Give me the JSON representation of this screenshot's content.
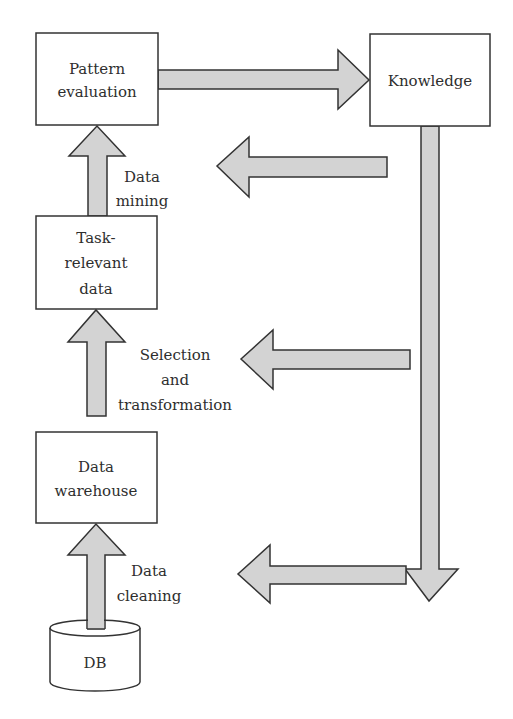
{
  "diagram": {
    "type": "flowchart",
    "colors": {
      "background": "#ffffff",
      "stroke": "#333333",
      "arrow_fill": "#d3d3d3",
      "text": "#2e2e2e"
    },
    "nodes": {
      "pattern_evaluation": {
        "line1": "Pattern",
        "line2": "evaluation"
      },
      "knowledge": {
        "label": "Knowledge"
      },
      "task_relevant_data": {
        "line1": "Task-",
        "line2": "relevant",
        "line3": "data"
      },
      "data_warehouse": {
        "line1": "Data",
        "line2": "warehouse"
      },
      "db": {
        "label": "DB"
      }
    },
    "edges": {
      "data_mining": {
        "line1": "Data",
        "line2": "mining",
        "from": "Task-relevant data",
        "to": "Pattern evaluation"
      },
      "selection_transformation": {
        "line1": "Selection",
        "line2": "and",
        "line3": "transformation",
        "from": "Data warehouse",
        "to": "Task-relevant data"
      },
      "data_cleaning": {
        "line1": "Data",
        "line2": "cleaning",
        "from": "DB",
        "to": "Data warehouse"
      },
      "evaluation_to_knowledge": {
        "from": "Pattern evaluation",
        "to": "Knowledge"
      },
      "feedback": [
        {
          "direction": "left",
          "level": "Pattern evaluation"
        },
        {
          "direction": "left",
          "level": "Task-relevant data"
        },
        {
          "direction": "left",
          "level": "Data warehouse"
        }
      ]
    }
  }
}
